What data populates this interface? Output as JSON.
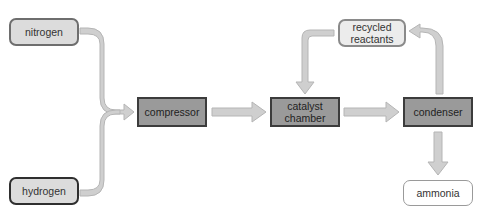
{
  "diagram": {
    "type": "process-flow",
    "nodes": [
      {
        "id": "nitrogen",
        "label": "nitrogen",
        "kind": "input"
      },
      {
        "id": "hydrogen",
        "label": "hydrogen",
        "kind": "input"
      },
      {
        "id": "compressor",
        "label": "compressor",
        "kind": "process"
      },
      {
        "id": "catalyst",
        "label": "catalyst chamber",
        "kind": "process"
      },
      {
        "id": "condenser",
        "label": "condenser",
        "kind": "process"
      },
      {
        "id": "recycled",
        "label": "recycled reactants",
        "kind": "recycle"
      },
      {
        "id": "ammonia",
        "label": "ammonia",
        "kind": "product"
      }
    ],
    "edges": [
      {
        "from": "nitrogen",
        "to": "compressor"
      },
      {
        "from": "hydrogen",
        "to": "compressor"
      },
      {
        "from": "compressor",
        "to": "catalyst"
      },
      {
        "from": "catalyst",
        "to": "condenser"
      },
      {
        "from": "condenser",
        "to": "recycled"
      },
      {
        "from": "recycled",
        "to": "catalyst"
      },
      {
        "from": "condenser",
        "to": "ammonia"
      }
    ],
    "colors": {
      "arrow_fill": "#cfcfcf",
      "arrow_stroke": "#b5b5b5",
      "process_fill": "#9a9a9a",
      "input_fill": "#dcdcdc"
    }
  }
}
